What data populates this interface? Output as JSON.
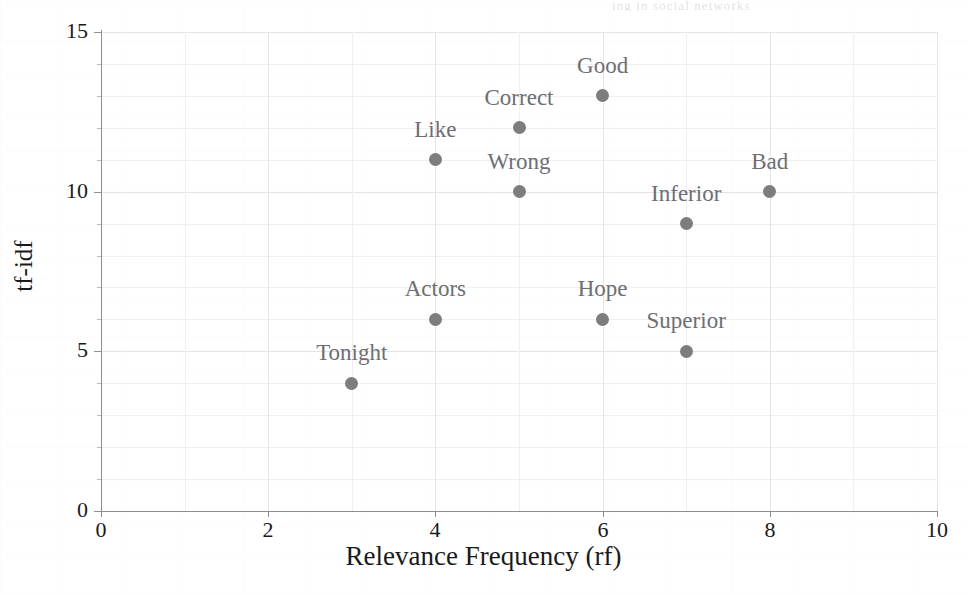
{
  "page": {
    "header_bleed_text": "ing in social networks"
  },
  "chart_data": {
    "type": "scatter",
    "title": "",
    "xlabel": "Relevance Frequency (rf)",
    "ylabel": "tf-idf",
    "xlim": [
      0,
      10
    ],
    "ylim": [
      0,
      15
    ],
    "xticks": [
      "0",
      "2",
      "4",
      "6",
      "8",
      "10"
    ],
    "xtick_values": [
      0,
      2,
      4,
      6,
      8,
      10
    ],
    "yticks": [
      "0",
      "5",
      "10",
      "15"
    ],
    "ytick_values": [
      0,
      5,
      10,
      15
    ],
    "grid": true,
    "legend": "none",
    "point_color": "#7d7d80",
    "label_color": "#6e6e72",
    "grid_color": "#e4e4e8",
    "axis_color": "#8d8d93",
    "points": [
      {
        "label": "Tonight",
        "x": 3,
        "y": 4,
        "label_dx": 0,
        "label_dy": -30
      },
      {
        "label": "Like",
        "x": 4,
        "y": 11,
        "label_dx": 0,
        "label_dy": -30
      },
      {
        "label": "Actors",
        "x": 4,
        "y": 6,
        "label_dx": 0,
        "label_dy": -30
      },
      {
        "label": "Correct",
        "x": 5,
        "y": 12,
        "label_dx": 0,
        "label_dy": -30
      },
      {
        "label": "Wrong",
        "x": 5,
        "y": 10,
        "label_dx": 0,
        "label_dy": -30
      },
      {
        "label": "Good",
        "x": 6,
        "y": 13,
        "label_dx": 0,
        "label_dy": -30
      },
      {
        "label": "Hope",
        "x": 6,
        "y": 6,
        "label_dx": 0,
        "label_dy": -30
      },
      {
        "label": "Inferior",
        "x": 7,
        "y": 9,
        "label_dx": 0,
        "label_dy": -30
      },
      {
        "label": "Superior",
        "x": 7,
        "y": 5,
        "label_dx": 0,
        "label_dy": -30
      },
      {
        "label": "Bad",
        "x": 8,
        "y": 10,
        "label_dx": 0,
        "label_dy": -30
      }
    ]
  }
}
